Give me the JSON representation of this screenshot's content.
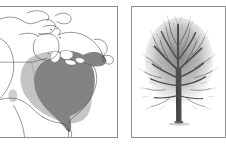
{
  "figure": {
    "panel_count": 2,
    "background_color": "#ffffff",
    "border_color": "#8e8e8e"
  },
  "panels": [
    {
      "id": "range-map",
      "kind": "map",
      "caption": "",
      "region": "North America",
      "map": {
        "land_outline_color": "#3a3a3a",
        "water_color": "#ffffff",
        "core_range_color": "#808080",
        "peripheral_range_color": "#b9b9b9",
        "lake_color": "#ffffff",
        "features": [
          "Arctic Canada coastline",
          "Hudson Bay",
          "Great Lakes",
          "Gulf of Mexico",
          "Florida peninsula",
          "United States - Canada border"
        ],
        "legend_items": [
          {
            "label": "Core range",
            "color": "#808080"
          },
          {
            "label": "Peripheral range",
            "color": "#b9b9b9"
          }
        ],
        "disjunct_population_present": true
      }
    },
    {
      "id": "tree-photo",
      "kind": "photograph",
      "caption": "",
      "subject": "Bare deciduous tree in winter",
      "photo": {
        "background_color": "#ffffff",
        "crown_color": "#767676",
        "branch_color": "#5a5a5a",
        "trunk_color": "#4a4a4a",
        "season": "leafless"
      }
    }
  ]
}
